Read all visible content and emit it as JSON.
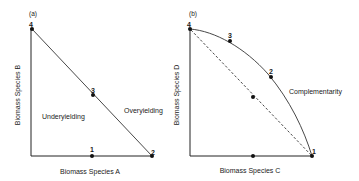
{
  "panels": [
    {
      "id": "a",
      "panel_label": "(a)",
      "x_axis_label": "Biomass Species A",
      "y_axis_label": "Biomass Species B",
      "regions": {
        "below": "Underyielding",
        "above": "Overyielding"
      },
      "line_style": "solid-straight",
      "points": [
        {
          "label": "4",
          "x": 0,
          "y": 1
        },
        {
          "label": "3",
          "x": 0.5,
          "y": 0.5
        },
        {
          "label": "2",
          "x": 1,
          "y": 0
        },
        {
          "label": "1",
          "x": 0.5,
          "y": 0
        }
      ]
    },
    {
      "id": "b",
      "panel_label": "(b)",
      "x_axis_label": "Biomass Species C",
      "y_axis_label": "Biomass Species D",
      "curve_label": "Complementarity",
      "line_style": "solid-convex-curve with dashed diagonal",
      "points": [
        {
          "label": "4",
          "x": 0,
          "y": 1
        },
        {
          "label": "3",
          "x": 0.33,
          "y": 0.9
        },
        {
          "label": "2",
          "x": 0.66,
          "y": 0.62
        },
        {
          "label": "1",
          "x": 1,
          "y": 0
        },
        {
          "label": "",
          "x": 0.5,
          "y": 0.5
        },
        {
          "label": "",
          "x": 0.5,
          "y": 0
        }
      ]
    }
  ]
}
